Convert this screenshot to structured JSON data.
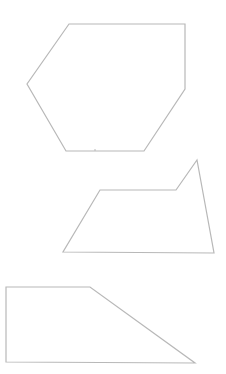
{
  "canvas": {
    "width": 226,
    "height": 374,
    "background": "#ffffff",
    "stroke_color": "#b8b8b8"
  },
  "shapes": [
    {
      "name": "hexagon",
      "sides": 6,
      "points": [
        [
          69,
          24
        ],
        [
          185,
          24
        ],
        [
          185,
          89
        ],
        [
          144,
          151
        ],
        [
          66,
          151
        ],
        [
          27,
          84
        ]
      ]
    },
    {
      "name": "pentagon",
      "sides": 5,
      "points": [
        [
          100,
          190
        ],
        [
          176,
          190
        ],
        [
          197,
          160
        ],
        [
          214,
          253
        ],
        [
          63,
          252
        ]
      ]
    },
    {
      "name": "right-trapezoid",
      "sides": 4,
      "points": [
        [
          6,
          287
        ],
        [
          90,
          287
        ],
        [
          195,
          363
        ],
        [
          6,
          362
        ]
      ]
    }
  ]
}
